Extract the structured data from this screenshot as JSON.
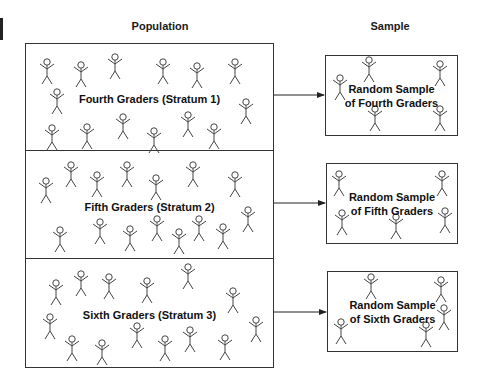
{
  "headings": {
    "population": "Population",
    "sample": "Sample"
  },
  "strata": [
    {
      "label": "Fourth Graders (Stratum 1)",
      "sample_line1": "Random Sample",
      "sample_line2": "of Fourth Graders"
    },
    {
      "label": "Fifth Graders (Stratum 2)",
      "sample_line1": "Random Sample",
      "sample_line2": "of Fifth Graders"
    },
    {
      "label": "Sixth Graders (Stratum 3)",
      "sample_line1": "Random Sample",
      "sample_line2": "of Sixth Graders"
    }
  ],
  "colors": {
    "stroke": "#333333",
    "text": "#111111",
    "background": "#ffffff"
  }
}
